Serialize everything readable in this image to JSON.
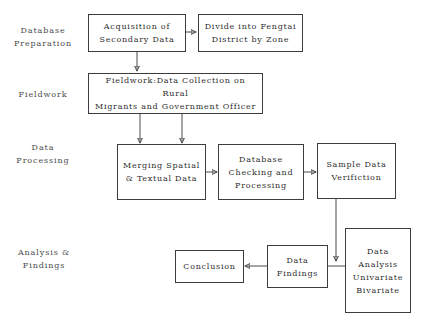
{
  "diagram": {
    "stage_labels": [
      {
        "id": "database-preparation",
        "text": "Database\nPreparation"
      },
      {
        "id": "fieldwork",
        "text": "Fieldwork"
      },
      {
        "id": "data-processing",
        "text": "Data\nProcessing"
      },
      {
        "id": "analysis-findings",
        "text": "Analysis  &\nFindings"
      }
    ],
    "nodes": [
      {
        "id": "acquisition-secondary-data",
        "text": "Acquisition of\nSecondary Data"
      },
      {
        "id": "divide-fengtai-zone",
        "text": "Divide into Fengtai\nDistrict by Zone"
      },
      {
        "id": "fieldwork-data-collection",
        "text": "Fieldwork:Data Collection on Rural\nMigrants and Government Officer"
      },
      {
        "id": "merging-spatial-textual",
        "text": "Merging Spatial\n& Textual Data"
      },
      {
        "id": "database-checking-processing",
        "text": "Database\nChecking and\nProcessing"
      },
      {
        "id": "sample-data-verification",
        "text": "Sample Data\nVerifiction"
      },
      {
        "id": "data-analysis-univariate-bivariate",
        "text": "Data\nAnalysis\nUnivariate\nBivariate"
      },
      {
        "id": "data-findings",
        "text": "Data\nFindings"
      },
      {
        "id": "conclusion",
        "text": "Conclusion"
      }
    ],
    "colors": {
      "border": "#3c3c3c",
      "text": "#2e2e2e",
      "label": "#4a4a4a",
      "background": "#ffffff"
    }
  }
}
